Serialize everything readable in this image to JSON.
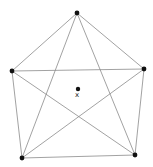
{
  "diagram": {
    "type": "complete-graph-K5",
    "vertices": [
      {
        "id": "top",
        "x": 77,
        "y": 13
      },
      {
        "id": "right",
        "x": 144,
        "y": 69
      },
      {
        "id": "bottom-right",
        "x": 135,
        "y": 155
      },
      {
        "id": "bottom-left",
        "x": 22,
        "y": 158
      },
      {
        "id": "left",
        "x": 12,
        "y": 71
      }
    ],
    "center_point": {
      "x": 78,
      "y": 89,
      "label": "x"
    },
    "colors": {
      "edge": "#8a8a8a",
      "vertex": "#111111"
    }
  }
}
